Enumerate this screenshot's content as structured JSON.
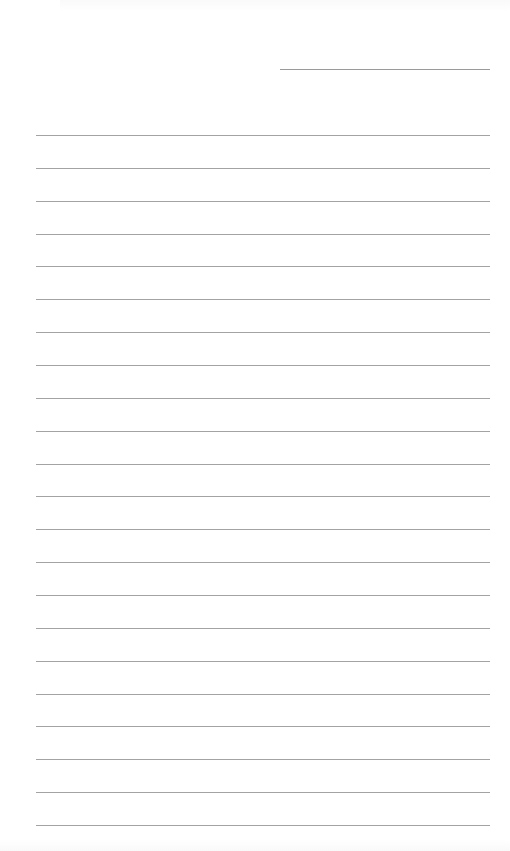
{
  "document": {
    "type": "lined-writing-paper",
    "header": {
      "has_short_header_line": true,
      "text": ""
    },
    "ruled_line_count": 22,
    "line_color": "#a3a3a3",
    "paper_color": "#ffffff",
    "content_text": ""
  }
}
